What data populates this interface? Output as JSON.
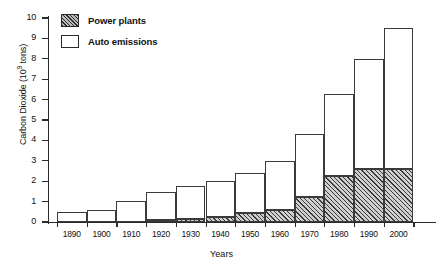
{
  "chart_data": {
    "type": "bar",
    "stacked": true,
    "title": "",
    "xlabel": "Years",
    "ylabel": "Carbon Dioxide (10^9 tons)",
    "ylabel_prefix": "Carbon Dioxide (10",
    "ylabel_exponent": "9",
    "ylabel_suffix": " tons)",
    "categories": [
      "1890",
      "1900",
      "1910",
      "1920",
      "1930",
      "1940",
      "1950",
      "1960",
      "1970",
      "1980",
      "1990",
      "2000"
    ],
    "ylim": [
      0,
      10
    ],
    "ytick_labels": [
      "0",
      "1",
      "2",
      "3",
      "4",
      "5",
      "6",
      "7",
      "8",
      "9",
      "10"
    ],
    "ytick_values": [
      0,
      1,
      2,
      3,
      4,
      5,
      6,
      7,
      8,
      9,
      10
    ],
    "grid": false,
    "legend_position": "top-left",
    "series": [
      {
        "name": "Power plants",
        "fill": "hatched",
        "values": [
          0,
          0,
          0,
          0.1,
          0.15,
          0.25,
          0.45,
          0.6,
          1.25,
          2.25,
          2.6,
          2.6
        ]
      },
      {
        "name": "Auto emissions",
        "fill": "white",
        "values": [
          0.5,
          0.6,
          1.05,
          1.35,
          1.6,
          1.75,
          1.95,
          2.4,
          3.05,
          4.05,
          5.4,
          6.9
        ]
      }
    ],
    "totals": [
      0.5,
      0.6,
      1.05,
      1.45,
      1.75,
      2.0,
      2.4,
      3.0,
      4.3,
      6.3,
      8.0,
      9.5
    ]
  },
  "legend": {
    "items": [
      {
        "label": "Power plants",
        "swatch": "power"
      },
      {
        "label": "Auto emissions",
        "swatch": "auto"
      }
    ]
  }
}
